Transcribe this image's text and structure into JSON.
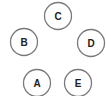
{
  "diagram": {
    "type": "node-graph",
    "stroke_color": "#7a7a7a",
    "text_color": "#222222",
    "background": "#ffffff",
    "nodes": [
      {
        "id": "C",
        "label": "C",
        "cx": 58,
        "cy": 16,
        "r": 13.5
      },
      {
        "id": "B",
        "label": "B",
        "cx": 24,
        "cy": 42,
        "r": 13.5
      },
      {
        "id": "D",
        "label": "D",
        "cx": 91,
        "cy": 43,
        "r": 13.5
      },
      {
        "id": "A",
        "label": "A",
        "cx": 37,
        "cy": 83,
        "r": 13.5
      },
      {
        "id": "E",
        "label": "E",
        "cx": 78,
        "cy": 83,
        "r": 13.5
      }
    ],
    "edges": []
  }
}
